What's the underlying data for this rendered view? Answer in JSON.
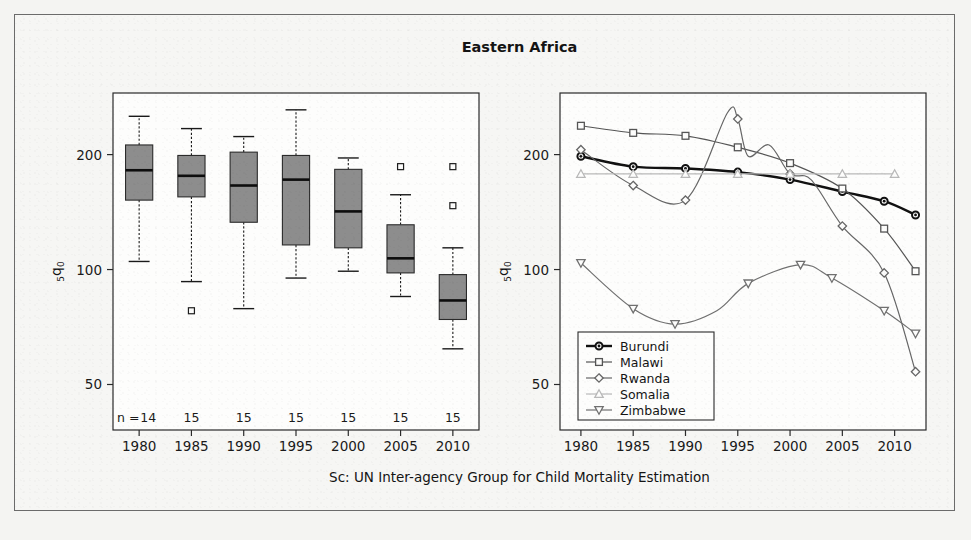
{
  "figure": {
    "title": "Eastern Africa",
    "caption": "Sc: UN Inter-agency Group for Child Mortality Estimation",
    "y_axis_label_main": "q",
    "y_axis_label_pre": "5",
    "y_axis_label_post": "0",
    "accent_colors": {
      "box_fill": "#8d8d8d",
      "frame": "#2a2a2a",
      "burundi": "#111111",
      "malawi": "#555555",
      "rwanda": "#666666",
      "somalia": "#b9b9b9",
      "zimbabwe": "#707070"
    }
  },
  "chart_data": [
    {
      "type": "box",
      "panel": "left",
      "title": "Eastern Africa",
      "xlabel": "",
      "ylabel": "5q0",
      "y_scale": "log",
      "ylim": [
        38,
        290
      ],
      "yticks": [
        50,
        100,
        200
      ],
      "ytick_labels": [
        "50",
        "100",
        "200"
      ],
      "categories": [
        1980,
        1985,
        1990,
        1995,
        2000,
        2005,
        2010
      ],
      "xtick_labels": [
        "1980",
        "1985",
        "1990",
        "1995",
        "2000",
        "2005",
        "2010"
      ],
      "n_prefix": "n =",
      "counts": [
        14,
        15,
        15,
        15,
        15,
        15,
        15
      ],
      "grid": false,
      "boxes": [
        {
          "category": "1980",
          "whisker_low": 105,
          "q1": 152,
          "median": 182,
          "q3": 212,
          "whisker_high": 252,
          "outliers": []
        },
        {
          "category": "1985",
          "whisker_low": 93,
          "q1": 155,
          "median": 176,
          "q3": 199,
          "whisker_high": 234,
          "outliers": [
            78
          ]
        },
        {
          "category": "1990",
          "whisker_low": 79,
          "q1": 133,
          "median": 166,
          "q3": 203,
          "whisker_high": 223,
          "outliers": []
        },
        {
          "category": "1995",
          "whisker_low": 95,
          "q1": 116,
          "median": 172,
          "q3": 199,
          "whisker_high": 262,
          "outliers": []
        },
        {
          "category": "2000",
          "whisker_low": 99,
          "q1": 114,
          "median": 142,
          "q3": 183,
          "whisker_high": 196,
          "outliers": []
        },
        {
          "category": "2005",
          "whisker_low": 85,
          "q1": 98,
          "median": 107,
          "q3": 131,
          "whisker_high": 157,
          "outliers": [
            186
          ]
        },
        {
          "category": "2010",
          "whisker_low": 62,
          "q1": 74,
          "median": 83,
          "q3": 97,
          "whisker_high": 114,
          "outliers": [
            186,
            147
          ]
        }
      ]
    },
    {
      "type": "line",
      "panel": "right",
      "xlabel": "",
      "ylabel": "5q0",
      "y_scale": "log",
      "ylim": [
        38,
        290
      ],
      "yticks": [
        50,
        100,
        200
      ],
      "ytick_labels": [
        "50",
        "100",
        "200"
      ],
      "xlim": [
        1978,
        2013
      ],
      "xticks": [
        1980,
        1985,
        1990,
        1995,
        2000,
        2005,
        2010
      ],
      "xtick_labels": [
        "1980",
        "1985",
        "1990",
        "1995",
        "2000",
        "2005",
        "2010"
      ],
      "grid": false,
      "legend_position": "bottom-left",
      "series": [
        {
          "name": "Burundi",
          "marker": "circle-filled",
          "color": "#111111",
          "width": 2.4,
          "x": [
            1980,
            1985,
            1990,
            1995,
            2000,
            2005,
            2009,
            2012
          ],
          "y": [
            198,
            186,
            184,
            180,
            172,
            160,
            151,
            139
          ]
        },
        {
          "name": "Malawi",
          "marker": "square",
          "color": "#555555",
          "width": 1.2,
          "x": [
            1980,
            1985,
            1990,
            1995,
            2000,
            2005,
            2009,
            2012
          ],
          "y": [
            238,
            228,
            224,
            209,
            190,
            163,
            128,
            99
          ]
        },
        {
          "name": "Rwanda",
          "marker": "diamond",
          "color": "#666666",
          "width": 1.2,
          "x": [
            1980,
            1985,
            1990,
            1994,
            1995,
            1996,
            1998,
            2000,
            2002,
            2005,
            2009,
            2012
          ],
          "y": [
            206,
            166,
            152,
            257,
            248,
            198,
            212,
            178,
            172,
            130,
            98,
            54
          ]
        },
        {
          "name": "Somalia",
          "marker": "triangle-up",
          "color": "#b9b9b9",
          "width": 1.2,
          "x": [
            1980,
            1985,
            1990,
            1995,
            2000,
            2005,
            2010
          ],
          "y": [
            178,
            178,
            178,
            178,
            178,
            178,
            178
          ]
        },
        {
          "name": "Zimbabwe",
          "marker": "triangle-down",
          "color": "#707070",
          "width": 1.2,
          "x": [
            1980,
            1985,
            1989,
            1993,
            1996,
            2001,
            2004,
            2009,
            2012
          ],
          "y": [
            104,
            79,
            72,
            78,
            92,
            103,
            95,
            78,
            68
          ]
        }
      ]
    }
  ]
}
